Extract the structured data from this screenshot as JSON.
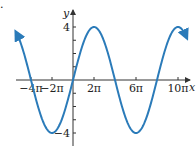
{
  "chart_data": {
    "type": "line",
    "title": "",
    "function": "y = 4 sin(x/4)",
    "xlabel": "x",
    "ylabel": "y",
    "x_range_pi": [
      -5,
      11
    ],
    "ylim": [
      -4.6,
      4.6
    ],
    "grid": false,
    "legend": null,
    "x_ticks_pi": [
      -4,
      -2,
      2,
      6,
      10
    ],
    "x_tick_labels": [
      "−4π",
      "−2π",
      "2π",
      "6π",
      "10π"
    ],
    "y_ticks": [
      -4,
      -3,
      -2,
      -1,
      1,
      2,
      3,
      4
    ],
    "y_tick_labels": [
      {
        "value": 4,
        "label": "4"
      },
      {
        "value": -4,
        "label": "−4"
      }
    ],
    "series": [
      {
        "name": "4 sin(x/4)",
        "color": "#2b7bb9",
        "amplitude": 4,
        "period_pi": 8,
        "x_start_pi": -5.4,
        "x_end_pi": 10.8,
        "arrows_at_ends": true,
        "key_points_pi": [
          {
            "x": -4,
            "y": 0
          },
          {
            "x": -2,
            "y": -4
          },
          {
            "x": 0,
            "y": 0
          },
          {
            "x": 2,
            "y": 4
          },
          {
            "x": 4,
            "y": 0
          },
          {
            "x": 6,
            "y": -4
          },
          {
            "x": 8,
            "y": 0
          },
          {
            "x": 10,
            "y": 4
          }
        ]
      }
    ]
  },
  "colors": {
    "curve": "#2b7bb9",
    "axis": "#333333"
  },
  "corner_mark": "."
}
